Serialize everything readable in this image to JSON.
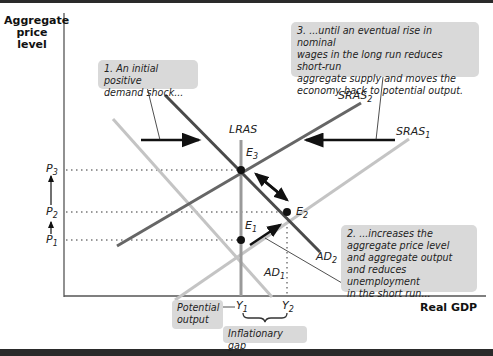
{
  "axes": {
    "y_title_lines": [
      "Aggregate",
      "price",
      "level"
    ],
    "x_title": "Real GDP"
  },
  "curves": {
    "lras": "LRAS",
    "sras1": {
      "base": "SRAS",
      "sub": "1"
    },
    "sras2": {
      "base": "SRAS",
      "sub": "2"
    },
    "ad1": {
      "base": "AD",
      "sub": "1"
    },
    "ad2": {
      "base": "AD",
      "sub": "2"
    }
  },
  "points": {
    "e1": {
      "base": "E",
      "sub": "1"
    },
    "e2": {
      "base": "E",
      "sub": "2"
    },
    "e3": {
      "base": "E",
      "sub": "3"
    }
  },
  "price_ticks": {
    "p1": {
      "base": "P",
      "sub": "1"
    },
    "p2": {
      "base": "P",
      "sub": "2"
    },
    "p3": {
      "base": "P",
      "sub": "3"
    }
  },
  "output_ticks": {
    "y1": {
      "base": "Y",
      "sub": "1"
    },
    "y2": {
      "base": "Y",
      "sub": "2"
    }
  },
  "annotations": {
    "note1_lines": [
      "1. An initial positive",
      "demand shock..."
    ],
    "note2_lines": [
      "2. ...increases the",
      "aggregate price level",
      "and aggregate output",
      "and reduces unemployment",
      "in the short run..."
    ],
    "note3_lines": [
      "3. ...until an eventual rise in nominal",
      "wages in the long run reduces short-run",
      "aggregate supply and moves the",
      "economy back to potential output."
    ],
    "potential_output_lines": [
      "Potential",
      "output"
    ],
    "inflationary_gap": "Inflationary gap"
  },
  "colors": {
    "dark_curve": "#555555",
    "light_curve": "#bdbdbd",
    "lras": "#9a9a9a",
    "note_bg": "#d9d9d9",
    "arrow": "#111111"
  }
}
